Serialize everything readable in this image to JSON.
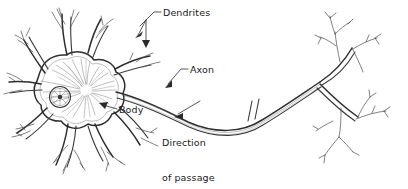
{
  "figure": {
    "style": "pen-and-ink line drawing",
    "background_color": "#ffffff",
    "ink_color": "#333333",
    "text_color": "#1a1a1a",
    "width": 408,
    "height": 189
  },
  "labels": {
    "dendrites": "Dendrites",
    "axon": "Axon",
    "body": "Body",
    "direction_line1": "Direction",
    "direction_line2": "of passage",
    "direction_line3": "of impulse"
  },
  "parts": {
    "soma": "cell body",
    "nucleus": "nucleus",
    "nucleolus": "nucleolus",
    "dendrite_count": 7,
    "node_of_ranvier": "node of ranvier",
    "terminal_branches": "axon terminal arborization"
  }
}
